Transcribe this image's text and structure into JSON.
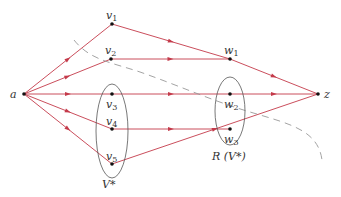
{
  "diagram": {
    "edge_color": "#c43a4a",
    "node_color": "#111111",
    "outline_color": "#555555",
    "dash_color": "#999999",
    "nodes": [
      {
        "id": "a",
        "label": "a",
        "sub": "",
        "x": 24,
        "y": 94
      },
      {
        "id": "v1",
        "label": "v",
        "sub": "1",
        "x": 112,
        "y": 24
      },
      {
        "id": "v2",
        "label": "v",
        "sub": "2",
        "x": 111,
        "y": 59
      },
      {
        "id": "v3",
        "label": "v",
        "sub": "3",
        "x": 112,
        "y": 94
      },
      {
        "id": "v4",
        "label": "v",
        "sub": "4",
        "x": 112,
        "y": 129
      },
      {
        "id": "v5",
        "label": "v",
        "sub": "5",
        "x": 112,
        "y": 164
      },
      {
        "id": "w1",
        "label": "w",
        "sub": "1",
        "x": 230,
        "y": 59
      },
      {
        "id": "w2",
        "label": "w",
        "sub": "2",
        "x": 230,
        "y": 94
      },
      {
        "id": "w3",
        "label": "w",
        "sub": "3",
        "x": 230,
        "y": 129
      },
      {
        "id": "z",
        "label": "z",
        "sub": "",
        "x": 318,
        "y": 94
      }
    ],
    "edges": [
      [
        "a",
        "v1"
      ],
      [
        "a",
        "v2"
      ],
      [
        "a",
        "v3"
      ],
      [
        "a",
        "v4"
      ],
      [
        "a",
        "v5"
      ],
      [
        "v1",
        "w1"
      ],
      [
        "v2",
        "w1"
      ],
      [
        "w1",
        "z"
      ],
      [
        "v3",
        "w2"
      ],
      [
        "w2",
        "z"
      ],
      [
        "v4",
        "w3"
      ],
      [
        "v5",
        "z"
      ]
    ],
    "set_labels": {
      "v_star": "V*",
      "r_v_star": "R (V*)"
    }
  }
}
